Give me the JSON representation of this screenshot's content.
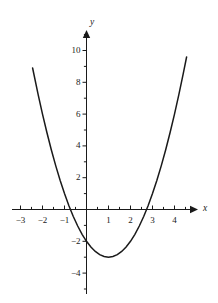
{
  "chart_data": {
    "type": "line",
    "title": "",
    "xlabel": "x",
    "ylabel": "y",
    "function": "y = x^2 - 2x - 2",
    "xlim": [
      -3.25,
      5.0
    ],
    "ylim": [
      -5.6,
      11.4
    ],
    "x_major_ticks": [
      -3,
      -2,
      -1,
      1,
      2,
      3,
      4
    ],
    "x_tick_labels": [
      "−3",
      "−2",
      "−1",
      "1",
      "2",
      "3",
      "4"
    ],
    "y_major_ticks": [
      2,
      4,
      6,
      8,
      10,
      -2,
      -4
    ],
    "y_tick_labels": [
      "2",
      "4",
      "6",
      "8",
      "10",
      "−2",
      "−4"
    ],
    "minor_tick_step": 0.5,
    "grid": false,
    "legend": false,
    "axis_arrows": [
      "x-positive",
      "y-positive"
    ],
    "curve": {
      "name": "parabola",
      "color": "#1a1a1a",
      "vertex": [
        1,
        -3
      ],
      "roots": [
        -0.732,
        2.732
      ],
      "y_intercept": -2,
      "x_start": -2.45,
      "x_end": 4.55,
      "x": [
        -2.45,
        -2.2,
        -2.0,
        -1.8,
        -1.6,
        -1.4,
        -1.2,
        -1.0,
        -0.8,
        -0.6,
        -0.4,
        -0.2,
        0.0,
        0.2,
        0.4,
        0.6,
        0.8,
        1.0,
        1.2,
        1.4,
        1.6,
        1.8,
        2.0,
        2.2,
        2.4,
        2.6,
        2.8,
        3.0,
        3.2,
        3.4,
        3.6,
        3.8,
        4.0,
        4.2,
        4.4,
        4.55
      ],
      "y": [
        8.9,
        7.24,
        6.0,
        4.84,
        3.76,
        2.76,
        1.84,
        1.0,
        0.24,
        -0.44,
        -1.04,
        -1.56,
        -2.0,
        -2.36,
        -2.64,
        -2.84,
        -2.96,
        -3.0,
        -2.96,
        -2.84,
        -2.64,
        -2.36,
        -2.0,
        -1.56,
        -1.04,
        -0.44,
        0.24,
        1.0,
        1.84,
        2.76,
        3.76,
        4.84,
        6.0,
        7.24,
        8.56,
        9.59
      ]
    }
  },
  "axes": {
    "x_name": "x",
    "y_name": "y"
  }
}
